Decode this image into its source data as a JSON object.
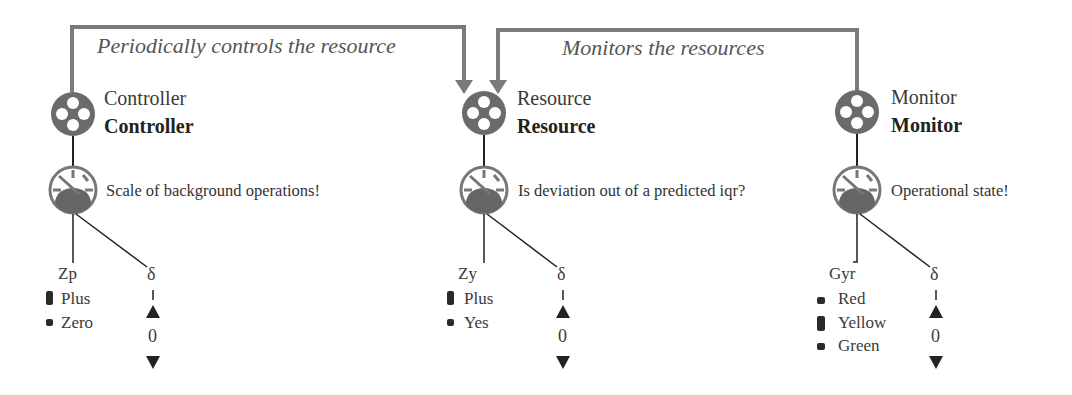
{
  "colors": {
    "node": "#6b6b6b",
    "line": "#222222",
    "arrow": "#7a7a7a",
    "marker": "#2a2a2a"
  },
  "edges": [
    {
      "label": "Periodically controls the resource",
      "from": "Controller",
      "to": "Resource"
    },
    {
      "label": "Monitors the resources",
      "from": "Monitor",
      "to": "Resource"
    }
  ],
  "nodes": [
    {
      "name": "Controller",
      "type_label": "Controller",
      "question": "Scale of background operations!",
      "variable": "Zp",
      "states": [
        {
          "label": "Plus",
          "marker": "tall"
        },
        {
          "label": "Zero",
          "marker": "small"
        }
      ],
      "delta": {
        "symbol": "δ",
        "up": "▲",
        "value": "0",
        "down": "▼"
      }
    },
    {
      "name": "Resource",
      "type_label": "Resource",
      "question": "Is deviation out of a predicted iqr?",
      "variable": "Zy",
      "states": [
        {
          "label": "Plus",
          "marker": "tall"
        },
        {
          "label": "Yes",
          "marker": "small"
        }
      ],
      "delta": {
        "symbol": "δ",
        "up": "▲",
        "value": "0",
        "down": "▼"
      }
    },
    {
      "name": "Monitor",
      "type_label": "Monitor",
      "question": "Operational state!",
      "variable": "Gyr",
      "states": [
        {
          "label": "Red",
          "marker": "small"
        },
        {
          "label": "Yellow",
          "marker": "tall"
        },
        {
          "label": "Green",
          "marker": "small"
        }
      ],
      "delta": {
        "symbol": "δ",
        "up": "▲",
        "value": "0",
        "down": "▼"
      }
    }
  ]
}
